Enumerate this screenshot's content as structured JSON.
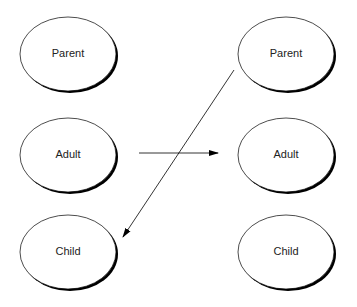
{
  "diagram": {
    "left_column": [
      {
        "id": "left-parent",
        "label": "Parent",
        "cx": 68,
        "cy": 54
      },
      {
        "id": "left-adult",
        "label": "Adult",
        "cx": 68,
        "cy": 155
      },
      {
        "id": "left-child",
        "label": "Child",
        "cx": 68,
        "cy": 252
      }
    ],
    "right_column": [
      {
        "id": "right-parent",
        "label": "Parent",
        "cx": 286,
        "cy": 54
      },
      {
        "id": "right-adult",
        "label": "Adult",
        "cx": 286,
        "cy": 155
      },
      {
        "id": "right-child",
        "label": "Child",
        "cx": 286,
        "cy": 252
      }
    ],
    "edges": [
      {
        "from": "left-adult",
        "to": "right-adult",
        "x1": 139,
        "y1": 153,
        "x2": 218,
        "y2": 153
      },
      {
        "from": "right-parent",
        "to": "left-child",
        "x1": 234,
        "y1": 70,
        "x2": 123,
        "y2": 237
      }
    ],
    "colors": {
      "stroke": "#000000",
      "shadow": "#000000",
      "fill": "#ffffff",
      "text": "#222222"
    }
  }
}
